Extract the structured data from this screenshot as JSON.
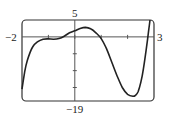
{
  "chart_data": {
    "type": "line",
    "title": "",
    "xlabel": "",
    "ylabel": "",
    "xlim": [
      -2,
      3
    ],
    "ylim": [
      -19,
      5
    ],
    "grid": false,
    "x_ticks": [
      -1,
      0,
      1,
      2
    ],
    "y_ticks": [
      -15,
      -10,
      -5
    ],
    "labels": {
      "xmin": "−2",
      "xmax": "3",
      "ymax": "5",
      "ymin": "−19"
    },
    "series": [
      {
        "name": "f(x)",
        "x": [
          -2.0,
          -1.9,
          -1.8,
          -1.6,
          -1.4,
          -1.2,
          -1.0,
          -0.8,
          -0.6,
          -0.4,
          -0.2,
          0.0,
          0.2,
          0.4,
          0.6,
          0.8,
          1.0,
          1.2,
          1.4,
          1.6,
          1.8,
          2.0,
          2.2,
          2.3,
          2.4,
          2.5,
          2.6,
          2.7,
          2.8,
          2.85
        ],
        "y": [
          -15.5,
          -10.5,
          -7.0,
          -3.0,
          -1.4,
          -0.7,
          -0.6,
          -0.7,
          -0.5,
          0.2,
          1.2,
          1.8,
          2.5,
          2.8,
          2.4,
          1.2,
          -0.5,
          -3.5,
          -7.5,
          -11.5,
          -15.0,
          -17.0,
          -17.6,
          -17.3,
          -16.2,
          -13.5,
          -9.5,
          -4.0,
          2.0,
          5.0
        ]
      }
    ]
  }
}
